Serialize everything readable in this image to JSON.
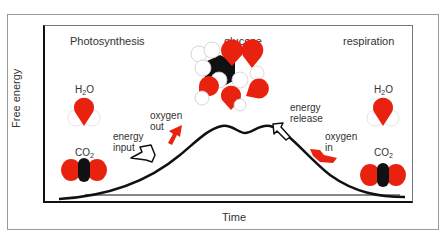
{
  "diagram": {
    "axes": {
      "y_label": "Free energy",
      "x_label": "Time"
    },
    "sections": {
      "left_title": "Photosynthesis",
      "center_title": "glucose",
      "right_title": "respiration"
    },
    "left_molecules": {
      "water": {
        "main": "H",
        "sub": "2",
        "tail": "O"
      },
      "carbon_dioxide": {
        "main": "CO",
        "sub": "2"
      }
    },
    "right_molecules": {
      "water": {
        "main": "H",
        "sub": "2",
        "tail": "O"
      },
      "carbon_dioxide": {
        "main": "CO",
        "sub": "2"
      }
    },
    "arrows": {
      "energy_input": {
        "line1": "energy",
        "line2": "input"
      },
      "oxygen_out": {
        "line1": "oxygen",
        "line2": "out"
      },
      "energy_release": {
        "line1": "energy",
        "line2": "release"
      },
      "oxygen_in": {
        "line1": "oxygen",
        "line2": "in"
      }
    },
    "colors": {
      "oxygen_atom": "#e8220e",
      "carbon_atom": "#111111",
      "hydrogen_atom": "#ffffff",
      "curve": "#111111"
    }
  }
}
